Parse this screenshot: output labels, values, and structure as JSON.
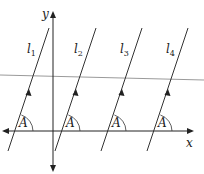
{
  "diagram": {
    "type": "coordinate-geometry",
    "axes": {
      "x_label": "x",
      "y_label": "y"
    },
    "lines": [
      {
        "label": "l",
        "sub": "1",
        "angle_label": "A"
      },
      {
        "label": "l",
        "sub": "2",
        "angle_label": "A"
      },
      {
        "label": "l",
        "sub": "3",
        "angle_label": "A"
      },
      {
        "label": "l",
        "sub": "4",
        "angle_label": "A"
      }
    ],
    "colors": {
      "lines": "#333333",
      "transversal": "#9a9a9a",
      "background": "#ffffff"
    }
  }
}
